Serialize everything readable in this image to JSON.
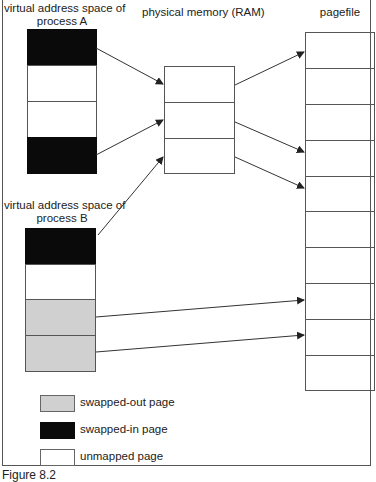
{
  "labels": {
    "process_a_line1": "virtual address space of",
    "process_a_line2": "process A",
    "ram": "physical memory (RAM)",
    "pagefile": "pagefile",
    "process_b_line1": "virtual address space of",
    "process_b_line2": "process B"
  },
  "colors": {
    "swapped_in": "#0a0a0a",
    "swapped_out": "#d0d0d0",
    "unmapped": "#ffffff",
    "stroke": "#555555"
  },
  "process_a": {
    "pages": [
      "swapped-in",
      "unmapped",
      "unmapped",
      "swapped-in"
    ]
  },
  "process_b": {
    "pages": [
      "swapped-in",
      "unmapped",
      "swapped-out",
      "swapped-out"
    ]
  },
  "ram": {
    "frame_count": 3
  },
  "pagefile": {
    "slot_count": 10
  },
  "mappings": [
    {
      "from": "process A page 1",
      "to": "RAM frame 1"
    },
    {
      "from": "process A page 4",
      "to": "RAM frame 2"
    },
    {
      "from": "process B page 1",
      "to": "RAM frame 3"
    },
    {
      "from": "RAM frame 1",
      "to": "pagefile slot 1"
    },
    {
      "from": "RAM frame 2",
      "to": "pagefile slot 4"
    },
    {
      "from": "RAM frame 3",
      "to": "pagefile slot 5"
    },
    {
      "from": "process B page 3",
      "to": "pagefile slot 8"
    },
    {
      "from": "process B page 4",
      "to": "pagefile slot 9"
    }
  ],
  "legend": [
    {
      "label": "swapped-out page",
      "key": "swapped_out"
    },
    {
      "label": "swapped-in page",
      "key": "swapped_in"
    },
    {
      "label": "unmapped page",
      "key": "unmapped"
    }
  ],
  "caption": "Figure 8.2"
}
